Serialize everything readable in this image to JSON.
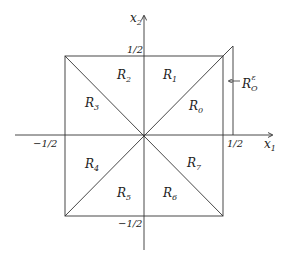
{
  "diagram": {
    "axes": {
      "x_label": "x",
      "x_sub": "1",
      "y_label": "x",
      "y_sub": "2"
    },
    "ticks": {
      "top": "1/2",
      "bottom": "−1/2",
      "left": "−1/2",
      "right": "1/2"
    },
    "regions": [
      {
        "name": "R",
        "sub": "0"
      },
      {
        "name": "R",
        "sub": "1"
      },
      {
        "name": "R",
        "sub": "2"
      },
      {
        "name": "R",
        "sub": "3"
      },
      {
        "name": "R",
        "sub": "4"
      },
      {
        "name": "R",
        "sub": "5"
      },
      {
        "name": "R",
        "sub": "6"
      },
      {
        "name": "R",
        "sub": "7"
      }
    ],
    "annotation": {
      "name": "R",
      "sub": "O",
      "sup": "ε"
    },
    "colors": {
      "line": "#333333",
      "background": "#ffffff"
    }
  }
}
